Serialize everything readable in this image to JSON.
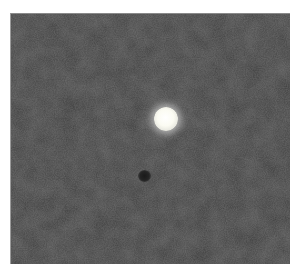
{
  "image": {
    "description": "Grayscale noisy dark field with a single bright glowing circular spot and a faint small dark spot",
    "frame": {
      "left": 10,
      "top": 13,
      "width": 279,
      "height": 250
    },
    "background_color": "#3b3b3b",
    "border_color": "#ffffff",
    "features": [
      {
        "type": "bright-spot",
        "cx": 165,
        "cy": 118,
        "radius": 12,
        "color": "#ffffff"
      },
      {
        "type": "dark-spot",
        "cx": 143,
        "cy": 175,
        "radius": 6,
        "color": "#1a1a1a"
      }
    ]
  }
}
